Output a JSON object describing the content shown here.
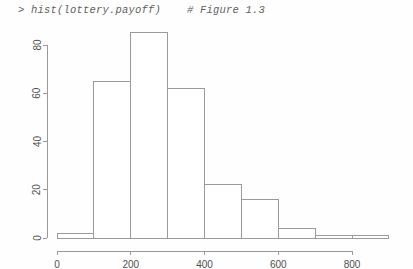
{
  "console": {
    "prompt": ">",
    "command": "hist(lottery.payoff)",
    "comment": "# Figure 1.3"
  },
  "chart_data": {
    "type": "bar",
    "chart_subtype": "histogram",
    "title": "",
    "subtitle": "",
    "xlabel": "",
    "ylabel": "",
    "bin_width": 100,
    "bin_edges": [
      0,
      100,
      200,
      300,
      400,
      500,
      600,
      700,
      800,
      900
    ],
    "categories": [
      "0-100",
      "100-200",
      "200-300",
      "300-400",
      "400-500",
      "500-600",
      "600-700",
      "700-800",
      "800-900"
    ],
    "values": [
      2,
      65,
      85,
      62,
      22,
      16,
      4,
      1,
      1
    ],
    "xlim": [
      0,
      900
    ],
    "ylim": [
      0,
      88
    ],
    "xticks": [
      0,
      200,
      400,
      600,
      800
    ],
    "xtick_labels": [
      "0",
      "200",
      "400",
      "600",
      "800"
    ],
    "yticks": [
      0,
      20,
      40,
      60,
      80
    ],
    "ytick_labels": [
      "0",
      "20",
      "40",
      "60",
      "80"
    ],
    "grid": false,
    "legend": false,
    "legend_position": "none",
    "bar_fill": "#ffffff",
    "bar_stroke": "#9a9a9a",
    "axis_color": "#9a9a9a",
    "text_color": "#4f4f4f",
    "background": "#fefefe"
  }
}
